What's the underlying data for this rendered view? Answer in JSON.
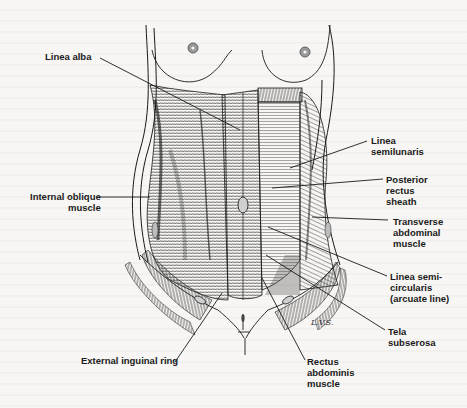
{
  "figure": {
    "artist_signature": "L.V.S."
  },
  "labels": [
    {
      "id": "linea-alba",
      "text": "Linea alba",
      "side": "left"
    },
    {
      "id": "internal-oblique",
      "text": "Internal oblique\nmuscle",
      "side": "left"
    },
    {
      "id": "external-inguinal-ring",
      "text": "External inguinal ring",
      "side": "left"
    },
    {
      "id": "linea-semilunaris",
      "text": "Linea\nsemilunaris",
      "side": "right"
    },
    {
      "id": "posterior-rectus-sheath",
      "text": "Posterior\nrectus\nsheath",
      "side": "right"
    },
    {
      "id": "transverse-abdominal",
      "text": "Transverse\nabdominal\nmuscle",
      "side": "right"
    },
    {
      "id": "linea-semicircularis",
      "text": "Linea semi-\ncircularis\n(arcuate line)",
      "side": "right"
    },
    {
      "id": "tela-subserosa",
      "text": "Tela\nsubserosa",
      "side": "right"
    },
    {
      "id": "rectus-abdominis",
      "text": "Rectus\nabdominis\nmuscle",
      "side": "bottom"
    }
  ],
  "colors": {
    "ink": "#1a1a1a",
    "paper": "#f7f6f4",
    "shade": "#6b6b6b"
  }
}
